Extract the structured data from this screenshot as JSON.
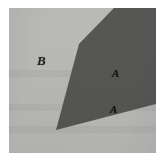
{
  "figure": {
    "background_color": "#ffffff",
    "plate": {
      "width_px": 147,
      "height_px": 145,
      "offset_x_px": 9,
      "offset_y_px": 8
    },
    "regions": [
      {
        "id": "region-b",
        "label": "B",
        "fill_color": "#b9b9b7",
        "description": "light gray background region occupying the left and lower-right of the plate"
      },
      {
        "id": "region-a",
        "label": "A",
        "fill_color": "#565654",
        "description": "dark gray convex polygon occupying the upper-right and center of the plate",
        "vertices_percent": [
          [
            71.4,
            0.0
          ],
          [
            100.0,
            0.0
          ],
          [
            100.0,
            66.2
          ],
          [
            32.0,
            84.1
          ],
          [
            47.6,
            24.8
          ]
        ]
      }
    ],
    "labels": [
      {
        "id": "label-b",
        "text": "B",
        "region": "region-b",
        "x_px": 28,
        "y_px": 46,
        "font_size_px": 13,
        "style": "bold-italic-serif",
        "color": "#26261f"
      },
      {
        "id": "label-a-1",
        "text": "A",
        "region": "region-a",
        "x_px": 103,
        "y_px": 60,
        "font_size_px": 11,
        "style": "bold-italic-serif",
        "color": "#16160f"
      },
      {
        "id": "label-a-2",
        "text": "A",
        "region": "region-a",
        "x_px": 101,
        "y_px": 96,
        "font_size_px": 11,
        "style": "bold-italic-serif",
        "color": "#121209"
      }
    ]
  }
}
